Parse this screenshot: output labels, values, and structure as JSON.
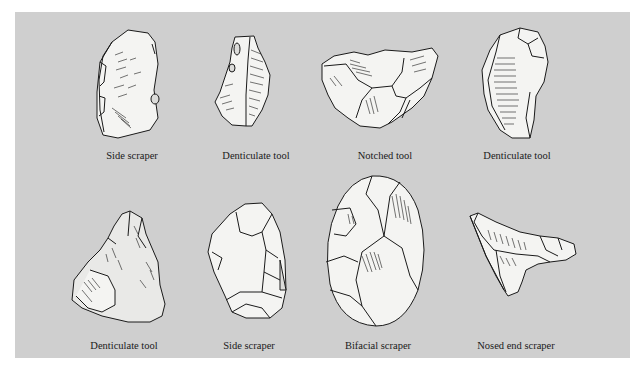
{
  "figure": {
    "background_color": "#cfcfcf",
    "stone_fill": "#f4f4f2",
    "shade_fill": "#dcdcda",
    "line_color": "#1a1a1a",
    "tools": [
      {
        "id": "side-scraper-1",
        "label": "Side scraper",
        "row": 1,
        "col": 1
      },
      {
        "id": "denticulate-tool-1",
        "label": "Denticulate tool",
        "row": 1,
        "col": 2
      },
      {
        "id": "notched-tool",
        "label": "Notched tool",
        "row": 1,
        "col": 3
      },
      {
        "id": "denticulate-tool-2",
        "label": "Denticulate tool",
        "row": 1,
        "col": 4
      },
      {
        "id": "denticulate-tool-3",
        "label": "Denticulate tool",
        "row": 2,
        "col": 1
      },
      {
        "id": "side-scraper-2",
        "label": "Side scraper",
        "row": 2,
        "col": 2
      },
      {
        "id": "bifacial-scraper",
        "label": "Bifacial scraper",
        "row": 2,
        "col": 3
      },
      {
        "id": "nosed-end-scraper",
        "label": "Nosed end scraper",
        "row": 2,
        "col": 4
      }
    ]
  }
}
